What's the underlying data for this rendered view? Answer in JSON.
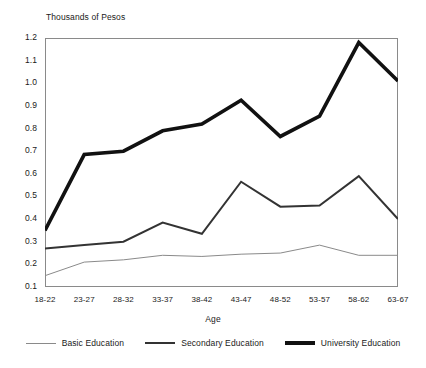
{
  "chart_data": {
    "type": "line",
    "title": "Thousands of Pesos",
    "xlabel": "Age",
    "ylabel": "Thousands of Pesos",
    "grid": false,
    "legend_position": "bottom",
    "ylim": [
      0.1,
      1.2
    ],
    "ytick_labels": [
      "1.2",
      "1.1",
      "1.0",
      "0.9",
      "0.8",
      "0.7",
      "0.6",
      "0.5",
      "0.4",
      "0.3",
      "0.2",
      "0.1"
    ],
    "yticks": [
      1.2,
      1.1,
      1.0,
      0.9,
      0.8,
      0.7,
      0.6,
      0.5,
      0.4,
      0.3,
      0.2,
      0.1
    ],
    "categories": [
      "18-22",
      "23-27",
      "28-32",
      "33-37",
      "38-42",
      "43-47",
      "48-52",
      "53-57",
      "58-62",
      "63-67"
    ],
    "series": [
      {
        "name": "Basic Education",
        "color": "#8a8a8a",
        "line_width": 1,
        "values": [
          0.15,
          0.21,
          0.22,
          0.24,
          0.235,
          0.245,
          0.25,
          0.285,
          0.24,
          0.24
        ]
      },
      {
        "name": "Secondary Education",
        "color": "#333333",
        "line_width": 2,
        "values": [
          0.27,
          0.285,
          0.3,
          0.385,
          0.335,
          0.565,
          0.455,
          0.46,
          0.59,
          0.4
        ]
      },
      {
        "name": "University Education",
        "color": "#111111",
        "line_width": 3.6,
        "values": [
          0.35,
          0.685,
          0.7,
          0.79,
          0.82,
          0.925,
          0.765,
          0.855,
          1.18,
          1.01
        ]
      }
    ]
  },
  "legend": {
    "items": [
      {
        "label": "Basic Education"
      },
      {
        "label": "Secondary Education"
      },
      {
        "label": "University Education"
      }
    ]
  }
}
